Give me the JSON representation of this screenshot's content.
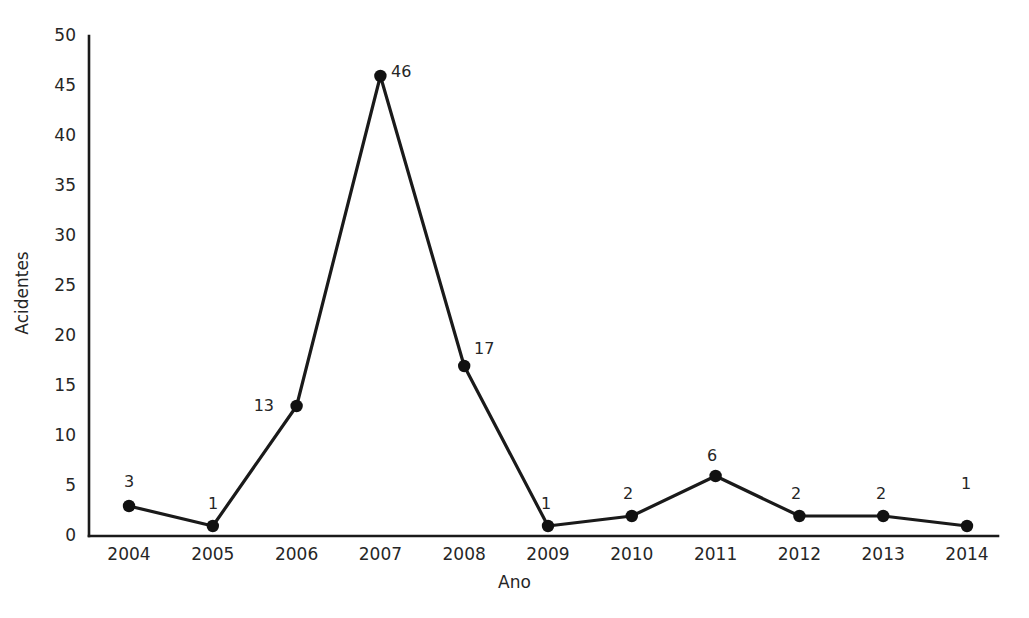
{
  "chart_data": {
    "type": "line",
    "title": "",
    "subtitle": "",
    "xlabel": "Ano",
    "ylabel": "Acidentes",
    "categories": [
      "2004",
      "2005",
      "2006",
      "2007",
      "2008",
      "2009",
      "2010",
      "2011",
      "2012",
      "2013",
      "2014"
    ],
    "values": [
      3,
      1,
      13,
      46,
      17,
      1,
      2,
      6,
      2,
      2,
      1
    ],
    "point_labels": [
      "3",
      "1",
      "13",
      "46",
      "17",
      "1",
      "2",
      "6",
      "2",
      "2",
      "1"
    ],
    "series": [
      {
        "name": "Acidentes",
        "values": [
          3,
          1,
          13,
          46,
          17,
          1,
          2,
          6,
          2,
          2,
          1
        ]
      }
    ],
    "xlim": [
      2004,
      2014
    ],
    "ylim": [
      0,
      50
    ],
    "ytick_labels": [
      "0",
      "5",
      "10",
      "15",
      "20",
      "25",
      "30",
      "35",
      "40",
      "45",
      "50"
    ],
    "ytick_values": [
      0,
      5,
      10,
      15,
      20,
      25,
      30,
      35,
      40,
      45,
      50
    ],
    "xtick_labels": [
      "2004",
      "2005",
      "2006",
      "2007",
      "2008",
      "2009",
      "2010",
      "2011",
      "2012",
      "2013",
      "2014"
    ],
    "grid": false,
    "legend": false,
    "legend_position": "none",
    "marker": "filled-circle",
    "line_color": "#1a1a1a",
    "marker_color": "#111111",
    "axis_color": "#1a1a1a",
    "background_color": "#ffffff",
    "text_color": "#262626"
  },
  "yticks": [
    {
      "label": "50",
      "value": 50
    },
    {
      "label": "45",
      "value": 45
    },
    {
      "label": "40",
      "value": 40
    },
    {
      "label": "35",
      "value": 35
    },
    {
      "label": "30",
      "value": 30
    },
    {
      "label": "25",
      "value": 25
    },
    {
      "label": "20",
      "value": 20
    },
    {
      "label": "15",
      "value": 15
    },
    {
      "label": "10",
      "value": 10
    },
    {
      "label": "5",
      "value": 5
    },
    {
      "label": "0",
      "value": 0
    }
  ],
  "xticks": [
    {
      "label": "2004"
    },
    {
      "label": "2005"
    },
    {
      "label": "2006"
    },
    {
      "label": "2007"
    },
    {
      "label": "2008"
    },
    {
      "label": "2009"
    },
    {
      "label": "2010"
    },
    {
      "label": "2011"
    },
    {
      "label": "2012"
    },
    {
      "label": "2013"
    },
    {
      "label": "2014"
    }
  ],
  "axis_titles": {
    "x": "Ano",
    "y": "Acidentes"
  },
  "point_labels": [
    {
      "text": "3",
      "x": 129,
      "y": 474,
      "align": "center"
    },
    {
      "text": "1",
      "x": 213,
      "y": 496,
      "align": "center"
    },
    {
      "text": "13",
      "x": 272,
      "y": 398,
      "align": "right"
    },
    {
      "text": "46",
      "x": 391,
      "y": 64,
      "align": "left"
    },
    {
      "text": "17",
      "x": 474,
      "y": 341,
      "align": "left"
    },
    {
      "text": "1",
      "x": 546,
      "y": 496,
      "align": "center"
    },
    {
      "text": "2",
      "x": 628,
      "y": 486,
      "align": "center"
    },
    {
      "text": "6",
      "x": 712,
      "y": 448,
      "align": "center"
    },
    {
      "text": "2",
      "x": 796,
      "y": 486,
      "align": "center"
    },
    {
      "text": "2",
      "x": 881,
      "y": 486,
      "align": "center"
    },
    {
      "text": "1",
      "x": 966,
      "y": 476,
      "align": "center"
    }
  ]
}
